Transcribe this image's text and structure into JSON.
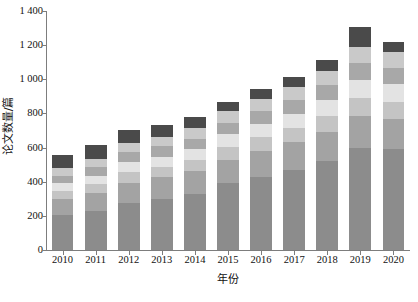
{
  "chart_data": {
    "type": "bar",
    "subtype": "stacked-bar",
    "title": "",
    "subtitle": "",
    "xlabel": "年份",
    "ylabel": "论文数量/篇",
    "categories": [
      "2010",
      "2011",
      "2012",
      "2013",
      "2014",
      "2015",
      "2016",
      "2017",
      "2018",
      "2019",
      "2020"
    ],
    "ylim": [
      0,
      1400
    ],
    "ytick_labels": [
      "0",
      "200",
      "400",
      "600",
      "800",
      "1 000",
      "1 200",
      "1 400"
    ],
    "ytick_values": [
      0,
      200,
      400,
      600,
      800,
      1000,
      1200,
      1400
    ],
    "grid": false,
    "legend": "none",
    "series": [
      {
        "name": "series-1",
        "color": "#8c8c8c",
        "values": [
          205,
          230,
          275,
          300,
          330,
          390,
          430,
          470,
          520,
          600,
          590
        ]
      },
      {
        "name": "series-2",
        "color": "#a3a3a3",
        "values": [
          95,
          105,
          120,
          125,
          130,
          140,
          150,
          160,
          170,
          185,
          180
        ]
      },
      {
        "name": "series-3",
        "color": "#c4c4c4",
        "values": [
          45,
          50,
          60,
          62,
          65,
          75,
          80,
          85,
          95,
          105,
          100
        ]
      },
      {
        "name": "series-4",
        "color": "#e3e3e3",
        "values": [
          45,
          50,
          60,
          60,
          65,
          72,
          78,
          82,
          92,
          105,
          102
        ]
      },
      {
        "name": "series-5",
        "color": "#a8a8a8",
        "values": [
          45,
          50,
          58,
          60,
          62,
          70,
          75,
          80,
          88,
          100,
          95
        ]
      },
      {
        "name": "series-6",
        "color": "#c9c9c9",
        "values": [
          45,
          48,
          55,
          58,
          60,
          68,
          72,
          78,
          85,
          95,
          92
        ]
      },
      {
        "name": "series-7",
        "color": "#4a4a4a",
        "values": [
          75,
          85,
          75,
          70,
          70,
          55,
          60,
          60,
          65,
          115,
          60
        ]
      }
    ],
    "totals": [
      555,
      618,
      703,
      735,
      782,
      870,
      945,
      1015,
      1115,
      1305,
      1219
    ]
  },
  "axes": {
    "y_title": "论文数量/篇",
    "x_title": "年份"
  },
  "colors": {
    "axis": "#7d7d7d",
    "text": "#111111",
    "background": "#ffffff"
  }
}
